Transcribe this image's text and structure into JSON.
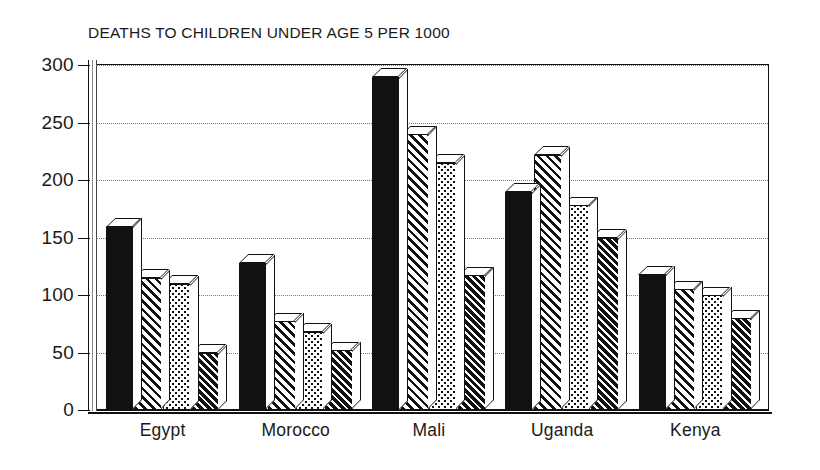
{
  "chart_data": {
    "type": "bar",
    "title": "DEATHS TO CHILDREN UNDER AGE 5 PER 1000",
    "xlabel": "",
    "ylabel": "",
    "ylim": [
      0,
      300
    ],
    "yticks": [
      0,
      50,
      100,
      150,
      200,
      250,
      300
    ],
    "grid": true,
    "legend": "none",
    "categories": [
      "Egypt",
      "Morocco",
      "Mali",
      "Uganda",
      "Kenya"
    ],
    "series": [
      {
        "name": "series-1",
        "pattern": "solid",
        "values": [
          160,
          128,
          290,
          190,
          118
        ]
      },
      {
        "name": "series-2",
        "pattern": "hatch",
        "values": [
          115,
          77,
          240,
          222,
          105
        ]
      },
      {
        "name": "series-3",
        "pattern": "dots",
        "values": [
          110,
          68,
          215,
          178,
          100
        ]
      },
      {
        "name": "series-4",
        "pattern": "dense-hatch",
        "values": [
          50,
          52,
          117,
          150,
          80
        ]
      }
    ],
    "colors": {
      "ink": "#111111",
      "background": "#ffffff",
      "gridline": "#777777"
    }
  },
  "axis": {
    "tick_labels": [
      "300",
      "250",
      "200",
      "150",
      "100",
      "50",
      "0"
    ]
  }
}
